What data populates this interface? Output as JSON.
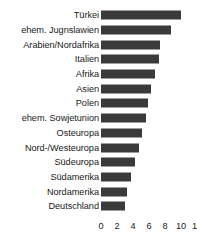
{
  "chart_data": {
    "type": "bar",
    "orientation": "horizontal",
    "title": "",
    "subtitle": "",
    "xlabel": "",
    "ylabel": "",
    "xlim": [
      0,
      12
    ],
    "grid": false,
    "legend": false,
    "bar_color": "#3a3a3a",
    "background_color": "#ffffff",
    "text_color": "#1a1a1a",
    "xticks": [
      0,
      2,
      4,
      6,
      8,
      10,
      12
    ],
    "xtick_labels": [
      "0",
      "2",
      "4",
      "6",
      "8",
      "10",
      "12"
    ],
    "categories": [
      "Türkei",
      "ehem. Jugnslawien",
      "Arabien/Nordafrika",
      "Italien",
      "Afrika",
      "Asien",
      "Polen",
      "ehem. Sowjetunion",
      "Osteuropa",
      "Nord-/Westeuropa",
      "Südeuropa",
      "Südamerika",
      "Nordamerika",
      "Deutschland"
    ],
    "values": [
      10.0,
      8.8,
      7.4,
      7.2,
      6.8,
      6.3,
      5.9,
      5.6,
      5.1,
      4.7,
      4.3,
      3.8,
      3.3,
      3.0
    ]
  }
}
